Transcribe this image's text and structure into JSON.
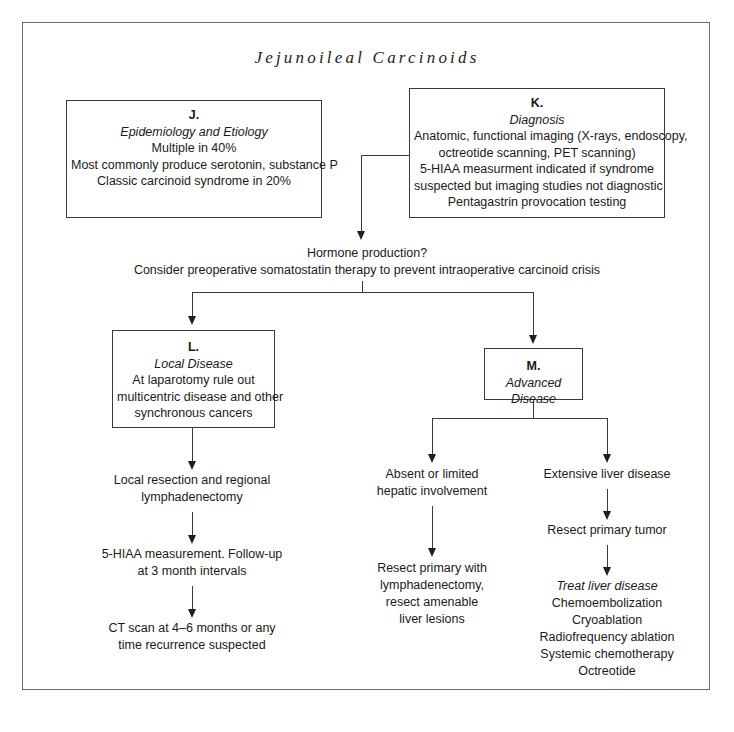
{
  "document": {
    "title": "Jejunoileal Carcinoids",
    "border_color": "#6b6b6b",
    "line_color": "#3a3a3a",
    "text_color": "#1a1a1a"
  },
  "nodes": {
    "j": {
      "letter": "J.",
      "subtitle": "Epidemiology and Etiology",
      "lines": [
        "Multiple in 40%",
        "Most commonly produce serotonin, substance P",
        "Classic carcinoid syndrome in 20%"
      ]
    },
    "k": {
      "letter": "K.",
      "subtitle": "Diagnosis",
      "lines": [
        "Anatomic, functional imaging (X-rays, endoscopy,",
        "octreotide scanning, PET scanning)",
        "5-HIAA measurment indicated if syndrome",
        "suspected but imaging studies not diagnostic",
        "Pentagastrin provocation testing"
      ]
    },
    "l": {
      "letter": "L.",
      "subtitle": "Local Disease",
      "lines": [
        "At laparotomy rule out",
        "multicentric disease and other",
        "synchronous cancers"
      ]
    },
    "m": {
      "letter": "M.",
      "subtitle": "Advanced Disease",
      "lines": []
    }
  },
  "steps": {
    "hormone": {
      "line1": "Hormone production?",
      "line2": "Consider preoperative somatostatin therapy to prevent intraoperative carcinoid crisis"
    },
    "local_resection": {
      "line1": "Local resection and regional",
      "line2": "lymphadenectomy"
    },
    "hiaa_followup": {
      "line1": "5-HIAA measurement. Follow-up",
      "line2": "at 3 month intervals"
    },
    "ct_scan": {
      "line1": "CT scan at 4–6 months or any",
      "line2": "time recurrence suspected"
    },
    "absent_limited": {
      "line1": "Absent or limited",
      "line2": "hepatic involvement"
    },
    "resect_primary_with": {
      "line1": "Resect primary with",
      "line2": "lymphadenectomy,",
      "line3": "resect amenable",
      "line4": "liver lesions"
    },
    "extensive_liver": {
      "line1": "Extensive liver disease"
    },
    "resect_primary_tumor": {
      "line1": "Resect primary tumor"
    },
    "treat_liver": {
      "heading": "Treat liver disease",
      "items": [
        "Chemoembolization",
        "Cryoablation",
        "Radiofrequency ablation",
        "Systemic chemotherapy",
        "Octreotide"
      ]
    }
  }
}
